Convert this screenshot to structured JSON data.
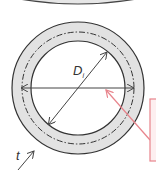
{
  "diagram": {
    "labels": {
      "inner_diameter": "D",
      "inner_diameter_subscript": "i",
      "thickness": "t"
    },
    "colors": {
      "wall_fill": "#e2e2e2",
      "stroke": "#333333",
      "callout": "#e8848c",
      "callout_box_fill": "#fdeff0"
    }
  }
}
